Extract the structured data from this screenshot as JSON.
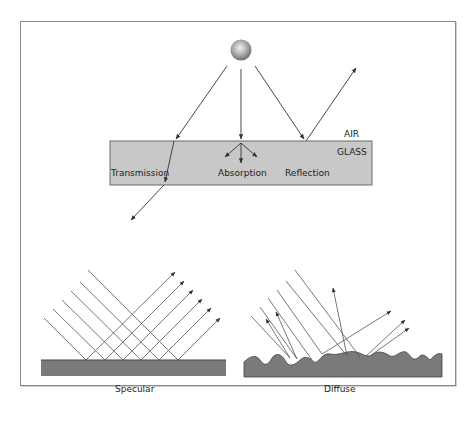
{
  "top_diagram": {
    "labels": {
      "air": "AIR",
      "glass": "GLASS",
      "transmission": "Transmission",
      "absorption": "Absorption",
      "reflection": "Reflection"
    },
    "colors": {
      "glass_fill": "#c8c8c8",
      "glass_stroke": "#6a6a6a",
      "ray": "#333333",
      "source": "#9a9a9a"
    }
  },
  "bottom_diagrams": {
    "specular_label": "Specular",
    "diffuse_label": "Diffuse",
    "colors": {
      "surface_fill": "#7a7a7a",
      "ray": "#444444"
    }
  }
}
